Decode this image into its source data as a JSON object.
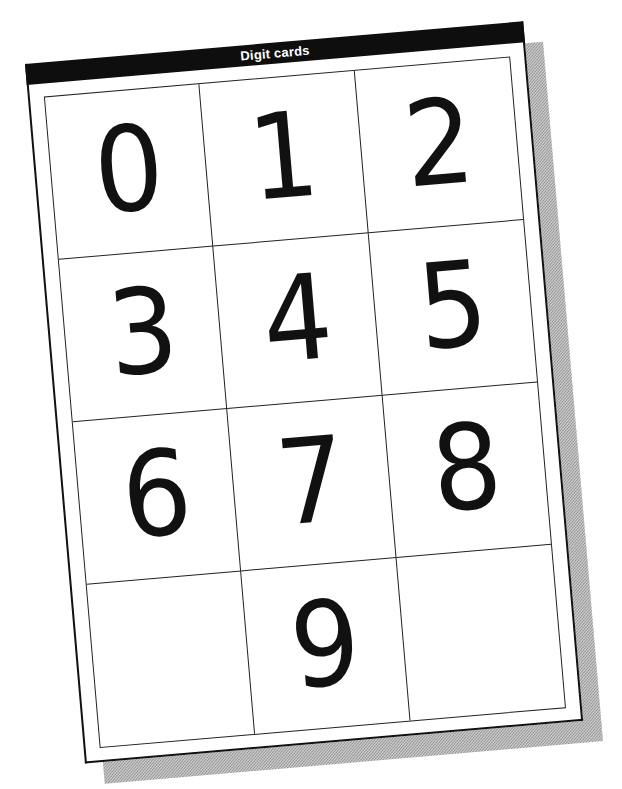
{
  "document": {
    "title": "Digit cards"
  },
  "cards": [
    {
      "label": "0"
    },
    {
      "label": "1"
    },
    {
      "label": "2"
    },
    {
      "label": "3"
    },
    {
      "label": "4"
    },
    {
      "label": "5"
    },
    {
      "label": "6"
    },
    {
      "label": "7"
    },
    {
      "label": "8"
    },
    {
      "label": ""
    },
    {
      "label": "9"
    },
    {
      "label": ""
    }
  ],
  "layout": {
    "columns": 3,
    "rows": 4
  },
  "colors": {
    "header_bg": "#0e0e0e",
    "header_text": "#ffffff",
    "ink": "#111111",
    "paper": "#ffffff",
    "shadow": "#a8a8a8"
  }
}
